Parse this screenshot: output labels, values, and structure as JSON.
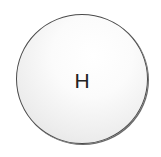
{
  "diagram": {
    "type": "atom",
    "atoms": [
      {
        "symbol": "H",
        "fill": "#f2f2f2",
        "stroke": "#4a4a4a",
        "label_color": "#222222"
      }
    ]
  }
}
